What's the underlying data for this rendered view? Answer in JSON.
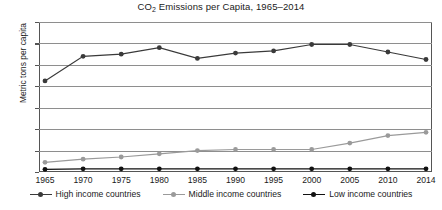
{
  "chart_data": {
    "type": "line",
    "title": "CO2 Emissions per Capita, 1965–2014",
    "title_prefix": "CO",
    "title_sub": "2",
    "title_rest": " Emissions per Capita, 1965–2014",
    "xlabel": "",
    "ylabel": "Metric tons per capita",
    "x": [
      1965,
      1970,
      1975,
      1980,
      1985,
      1990,
      1995,
      2000,
      2005,
      2010,
      2014
    ],
    "categories": [
      "1965",
      "1970",
      "1975",
      "1980",
      "1985",
      "1990",
      "1995",
      "2000",
      "2005",
      "2010",
      "2014"
    ],
    "yticks": [
      0,
      2,
      4,
      6,
      8,
      10,
      12,
      14
    ],
    "ylim": [
      0,
      14
    ],
    "grid": true,
    "legend_position": "bottom",
    "series": [
      {
        "name": "High income countries",
        "color": "#3a3a3a",
        "values": [
          8.5,
          10.8,
          11.0,
          11.6,
          10.6,
          11.1,
          11.3,
          11.9,
          11.9,
          11.2,
          10.5
        ]
      },
      {
        "name": "Middle income countries",
        "color": "#9a9a9a",
        "values": [
          0.9,
          1.2,
          1.4,
          1.7,
          2.0,
          2.1,
          2.1,
          2.1,
          2.7,
          3.4,
          3.7
        ]
      },
      {
        "name": "Low income countries",
        "color": "#111111",
        "values": [
          0.25,
          0.3,
          0.3,
          0.3,
          0.3,
          0.3,
          0.3,
          0.3,
          0.3,
          0.3,
          0.3
        ]
      }
    ]
  }
}
